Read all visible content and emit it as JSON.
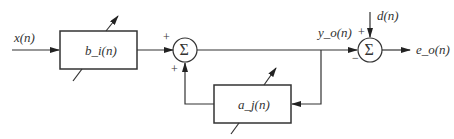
{
  "diagram": {
    "type": "adaptive IIR filter block diagram",
    "input_label": "x(n)",
    "forward_block_label": "b_i(n)",
    "feedback_block_label": "a_j(n)",
    "output_label": "y_o(n)",
    "desired_label": "d(n)",
    "error_label": "e_o(n)",
    "summer_symbol": "Σ",
    "summer1_signs": {
      "top": "+",
      "bottom": "+"
    },
    "summer2_signs": {
      "top": "+",
      "left": "−"
    }
  }
}
